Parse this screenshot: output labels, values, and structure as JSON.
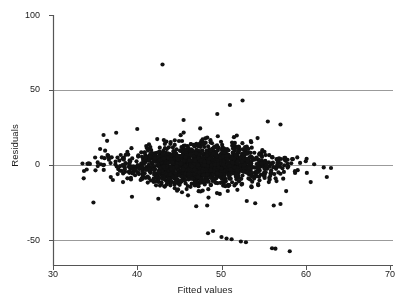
{
  "chart_data": {
    "type": "scatter",
    "title": "",
    "xlabel": "Fitted values",
    "ylabel": "Residuals",
    "xlim": [
      30,
      70
    ],
    "ylim": [
      -62,
      105
    ],
    "xticks": [
      30,
      40,
      50,
      60,
      70
    ],
    "yticks": [
      -50,
      0,
      50,
      100
    ],
    "xtick_labels": [
      "30",
      "40",
      "50",
      "60",
      "70"
    ],
    "ytick_labels": [
      "-50",
      "0",
      "50",
      "100"
    ],
    "grid": "horizontal reference lines at y = 50, 0, -50",
    "gridlines": [
      50,
      0,
      -50
    ],
    "legend": "none",
    "marker": {
      "shape": "circle",
      "color": "#111111",
      "size_px": 4.2,
      "count_approx": 1500
    },
    "colors": {
      "marker": "#111111",
      "axis": "#555555",
      "gridline": "#9b9b9b",
      "text": "#1a1a1a",
      "background": "#ffffff"
    },
    "annotations": [
      "single high outlier near (43, 67)",
      "cluster of low outliers near fitted 50-58 with residuals between -48 and -58"
    ],
    "cloud": {
      "description": "dense horizontal band of residuals centered on 0",
      "x_range": [
        33,
        63
      ],
      "y_core_range": [
        -22,
        22
      ],
      "x_center": 47.5,
      "x_spread": 4.6,
      "y_spread": 7.4
    },
    "points": [
      [
        43.0,
        67.0
      ],
      [
        50.0,
        -48.0
      ],
      [
        50.6,
        -49.0
      ],
      [
        51.2,
        -49.5
      ],
      [
        48.4,
        -45.5
      ],
      [
        49.0,
        -44.0
      ],
      [
        52.3,
        -51.0
      ],
      [
        52.9,
        -51.5
      ],
      [
        56.0,
        -55.5
      ],
      [
        56.4,
        -55.8
      ],
      [
        58.1,
        -57.5
      ],
      [
        34.8,
        -25.0
      ],
      [
        42.5,
        -22.5
      ],
      [
        47.0,
        -27.5
      ],
      [
        48.3,
        -27.0
      ],
      [
        53.0,
        -24.0
      ],
      [
        54.0,
        -25.5
      ],
      [
        56.2,
        -27.0
      ],
      [
        57.0,
        -26.0
      ],
      [
        62.5,
        -8.0
      ],
      [
        63.0,
        -2.0
      ],
      [
        61.0,
        0.5
      ],
      [
        60.0,
        2.5
      ],
      [
        55.5,
        29.0
      ],
      [
        57.0,
        27.0
      ],
      [
        51.0,
        40.0
      ],
      [
        52.5,
        43.0
      ],
      [
        49.5,
        34.0
      ],
      [
        45.5,
        30.0
      ],
      [
        40.0,
        24.0
      ],
      [
        37.5,
        21.5
      ],
      [
        36.0,
        20.0
      ],
      [
        33.5,
        1.0
      ],
      [
        34.0,
        -3.0
      ],
      [
        35.0,
        5.0
      ]
    ]
  }
}
